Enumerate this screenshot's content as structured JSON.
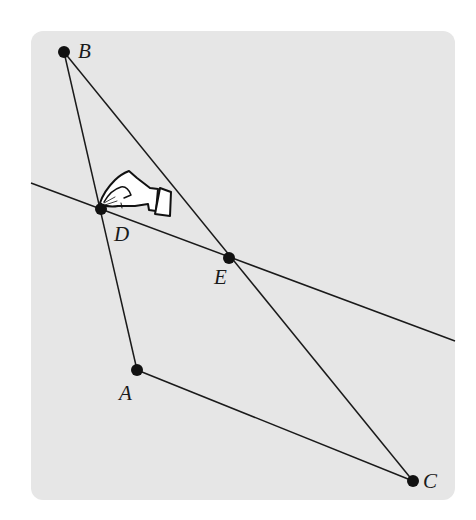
{
  "diagram": {
    "background_color": "#e6e6e6",
    "line_color": "#1a1a1a",
    "points": [
      {
        "id": "B",
        "label": "B",
        "x": 64,
        "y": 52,
        "label_x": 78,
        "label_y": 41
      },
      {
        "id": "D",
        "label": "D",
        "x": 101,
        "y": 209,
        "label_x": 114,
        "label_y": 224
      },
      {
        "id": "E",
        "label": "E",
        "x": 229,
        "y": 258,
        "label_x": 214,
        "label_y": 267
      },
      {
        "id": "A",
        "label": "A",
        "x": 137,
        "y": 370,
        "label_x": 119,
        "label_y": 383
      },
      {
        "id": "C",
        "label": "C",
        "x": 413,
        "y": 481,
        "label_x": 423,
        "label_y": 471
      }
    ],
    "segments": [
      {
        "from": "B",
        "to": "A"
      },
      {
        "from": "B",
        "to": "C"
      },
      {
        "from": "A",
        "to": "C"
      }
    ],
    "lines": [
      {
        "through": [
          "D",
          "E"
        ],
        "x1": 31,
        "y1": 183,
        "x2": 455,
        "y2": 341
      }
    ],
    "cursor": {
      "type": "grab-hand-cursor",
      "x": 97,
      "y": 168,
      "target_point": "D"
    }
  }
}
